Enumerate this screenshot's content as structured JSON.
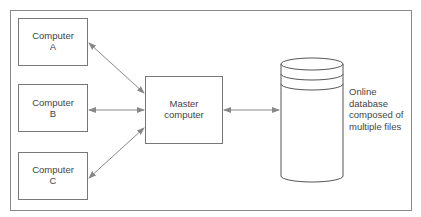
{
  "diagram": {
    "nodes": {
      "computer_a": {
        "line1": "Computer",
        "line2": "A"
      },
      "computer_b": {
        "line1": "Computer",
        "line2": "B"
      },
      "computer_c": {
        "line1": "Computer",
        "line2": "C"
      },
      "master": {
        "line1": "Master",
        "line2": "computer"
      },
      "database": {
        "line1": "Online",
        "line2": "database",
        "line3": "composed of",
        "line4": "multiple files"
      }
    },
    "edges": [
      {
        "from": "computer_a",
        "to": "master",
        "bidirectional": true
      },
      {
        "from": "computer_b",
        "to": "master",
        "bidirectional": true
      },
      {
        "from": "computer_c",
        "to": "master",
        "bidirectional": true
      },
      {
        "from": "master",
        "to": "database",
        "bidirectional": true
      }
    ],
    "colors": {
      "line": "#777777",
      "arrow": "#888888"
    }
  }
}
